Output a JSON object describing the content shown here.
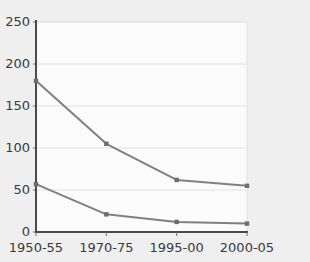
{
  "chart_data": {
    "type": "line",
    "title": "",
    "subtitle": "",
    "xlabel": "",
    "ylabel": "",
    "categories": [
      "1950-55",
      "1970-75",
      "1995-00",
      "2000-05"
    ],
    "series": [
      {
        "name": "upper-series",
        "values": [
          180,
          105,
          62,
          55
        ]
      },
      {
        "name": "lower-series",
        "values": [
          57,
          21,
          12,
          10
        ]
      }
    ],
    "ylim": [
      0,
      250
    ],
    "y_ticks": [
      0,
      50,
      100,
      150,
      200,
      250
    ],
    "y_tick_labels": [
      "0",
      "50",
      "100",
      "150",
      "200",
      "250"
    ],
    "x_tick_labels": [
      "1950-55",
      "1970-75",
      "1995-00",
      "2000-05"
    ],
    "grid": true,
    "grid_axis": "y",
    "legend": false,
    "legend_position": "none",
    "annotations": []
  },
  "style": {
    "page_background": "#efefef",
    "plot_background": "#fbfbfb",
    "grid_color": "#e2e2e2",
    "axis_color": "#4a4a4a",
    "line_color": "#808080",
    "marker_color": "#6e6e6e",
    "text_color": "#3a3a3a"
  }
}
